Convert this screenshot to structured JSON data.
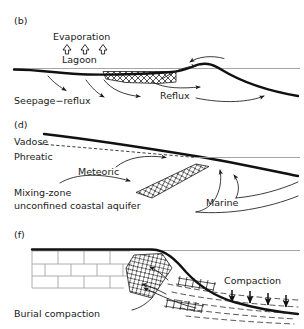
{
  "figure": {
    "background_color": "#ffffff",
    "ink_color": "#1a1a1a",
    "waterline_color": "#9a9a9a",
    "brick_color": "#9a9a9a"
  },
  "panels": [
    {
      "id": "b",
      "label": "(b)",
      "caption": "Seepage−reflux",
      "labels": {
        "evaporation": "Evaporation",
        "lagoon": "Lagoon",
        "reflux": "Reflux"
      },
      "evaporation_arrows": {
        "glyph": "⇧",
        "count": 3,
        "direction": "up",
        "style": "hollow"
      },
      "features": [
        "sea-level line",
        "lagoon floor profile",
        "cross-hatched evaporite/dolomite body",
        "shoal mound above water line",
        "downward seepage flow arrows",
        "basinward reflux flow arrows"
      ]
    },
    {
      "id": "d",
      "label": "(d)",
      "caption": "Mixing-zone",
      "caption2": "unconfined coastal aquifer",
      "labels": {
        "vadose": "Vadose",
        "phreatic": "Phreatic",
        "meteoric": "Meteoric",
        "marine": "Marine"
      },
      "features": [
        "land surface profile sloping to sea",
        "dashed water table separating vadose and phreatic zones",
        "sea-level line",
        "cross-hatched mixing zone band",
        "meteoric flow arrows directed seaward",
        "marine water circulation arrows directed landward"
      ]
    },
    {
      "id": "f",
      "label": "(f)",
      "caption": "Burial compaction",
      "labels": {
        "compaction": "Compaction"
      },
      "compaction_arrows": {
        "count": 4,
        "direction": "down"
      },
      "features": [
        "brick-pattern platform limestone",
        "cross-hatched slope body",
        "sea-level line",
        "thick basin-margin profile",
        "dashed basinal strata",
        "hatched fracture/stylolite bands",
        "ascending basinal fluid flow arrows"
      ]
    }
  ]
}
